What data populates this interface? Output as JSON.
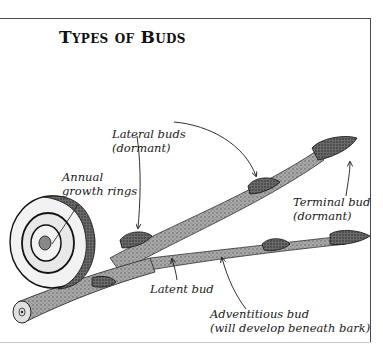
{
  "figure": {
    "title": "Types of Buds",
    "labels": {
      "lateral_buds": {
        "line1": "Lateral buds",
        "line2": "(dormant)"
      },
      "annual_rings": {
        "line1": "Annual",
        "line2": "growth rings"
      },
      "terminal_bud": {
        "line1": "Terminal bud",
        "line2": "(dormant)"
      },
      "latent_bud": {
        "line1": "Latent bud"
      },
      "adventitious_bud": {
        "line1": "Adventitious bud",
        "line2": "(will develop beneath bark)"
      }
    },
    "colors": {
      "ink": "#1a1a1a",
      "bark": "#9a9a9a",
      "bark_dark": "#5a5a5a",
      "bud": "#3a3a3a",
      "cut_face": "#e6e6e6",
      "frame": "#4a4a4a"
    }
  }
}
